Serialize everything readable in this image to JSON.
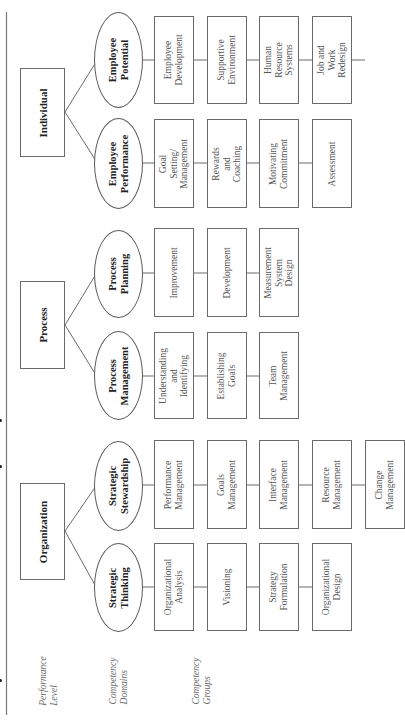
{
  "figure": {
    "orientation": "rotated-90-ccw",
    "row_labels": [
      {
        "id": "performance-level",
        "text": "Performance\nLevel"
      },
      {
        "id": "competency-domains",
        "text": "Competency\nDomains"
      },
      {
        "id": "competency-groups",
        "text": "Competency\nGroups"
      }
    ],
    "levels": [
      {
        "label": "Organization",
        "domains": [
          {
            "label": "Strategic\nThinking",
            "groups": [
              "Organizational\nAnalysis",
              "Visioning",
              "Strategy\nFormulation",
              "Organizational\nDesign"
            ]
          },
          {
            "label": "Strategic\nStewardship",
            "groups": [
              "Performance\nManagement",
              "Goals\nManagement",
              "Interface\nManagement",
              "Resource\nManagement",
              "Change\nManagement"
            ]
          }
        ]
      },
      {
        "label": "Process",
        "domains": [
          {
            "label": "Process\nManagement",
            "groups": [
              "Understanding\nand Identifying",
              "Establishing\nGoals",
              "Team\nManagement"
            ]
          },
          {
            "label": "Process\nPlanning",
            "groups": [
              "Improvement",
              "Development",
              "Measurement\nSystem Design"
            ]
          }
        ]
      },
      {
        "label": "Individual",
        "domains": [
          {
            "label": "Employee\nPerformance",
            "groups": [
              "Goal Setting/\nManagement",
              "Rewards and\nCoaching",
              "Motivating\nCommitment",
              "Assessment"
            ]
          },
          {
            "label": "Employee\nPotential",
            "groups": [
              "Employee\nDevelopment",
              "Supportive\nEnvironment",
              "Human Resource\nSystems",
              "Job and Work\nRedesign"
            ]
          }
        ]
      }
    ]
  },
  "colors": {
    "line": "#6a6a6a",
    "text": "#2a2a2a",
    "group_text": "#555555",
    "label_text": "#666666"
  }
}
